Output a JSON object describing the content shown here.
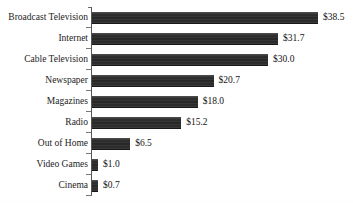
{
  "chart_data": {
    "type": "bar",
    "orientation": "horizontal",
    "title": "",
    "xlabel": "",
    "ylabel": "",
    "grid": false,
    "legend": null,
    "value_prefix": "$",
    "xlim": [
      0,
      38.5
    ],
    "categories": [
      "Broadcast Television",
      "Internet",
      "Cable Television",
      "Newspaper",
      "Magazines",
      "Radio",
      "Out of Home",
      "Video Games",
      "Cinema"
    ],
    "values": [
      38.5,
      31.7,
      30.0,
      20.7,
      18.0,
      15.2,
      6.5,
      1.0,
      0.7
    ],
    "data_labels": [
      "$38.5",
      "$31.7",
      "$30.0",
      "$20.7",
      "$18.0",
      "$15.2",
      "$6.5",
      "$1.0",
      "$0.7"
    ]
  },
  "style": {
    "bar_color": "#2b2b2b",
    "axis_color": "#555555",
    "text_color": "#1a1a1a",
    "background": "#ffffff"
  },
  "artifacts": {
    "cropped_title_remnant": ""
  }
}
